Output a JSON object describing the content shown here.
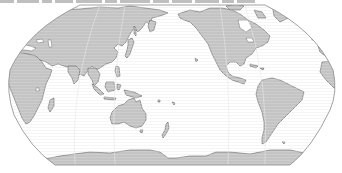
{
  "map": {
    "projection": "Robinson (Pacific-centered)",
    "central_meridian_label": "150°E",
    "colors": {
      "land": "#c4c4c4",
      "ocean": "#ffffff",
      "coastline": "#5a5a5a",
      "frame": "#8a8a8a"
    },
    "caption": {
      "visible": true,
      "text_legible": false,
      "note": "Top caption row is cut off at the top edge; only the bottom of the glyphs is visible."
    },
    "landmasses": [
      {
        "name": "Eurasia"
      },
      {
        "name": "Africa"
      },
      {
        "name": "Australia"
      },
      {
        "name": "North America"
      },
      {
        "name": "South America"
      },
      {
        "name": "Antarctica"
      },
      {
        "name": "Greenland"
      },
      {
        "name": "Japan"
      },
      {
        "name": "Madagascar"
      },
      {
        "name": "New Zealand"
      }
    ]
  }
}
